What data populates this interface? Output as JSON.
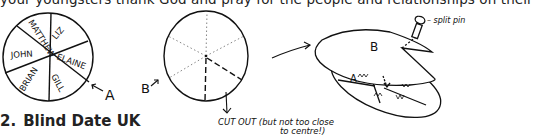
{
  "document": {
    "top_line": "your youngsters thank God and pray for the people and relationships on their",
    "section": {
      "number": "2.",
      "title": "Blind Date UK"
    }
  },
  "illustration": {
    "disc_a": {
      "label": "A",
      "names": [
        "MATTHEW",
        "LIZ",
        "ELAINE",
        "GILL",
        "BRIAN",
        "JOHN"
      ]
    },
    "disc_b": {
      "label": "B",
      "cutout_note_line1": "CUT OUT (but not too close",
      "cutout_note_line2": "to centre!)"
    },
    "assembly": {
      "top_label": "B",
      "bottom_label": "A",
      "pin_label": "– split pin"
    }
  }
}
